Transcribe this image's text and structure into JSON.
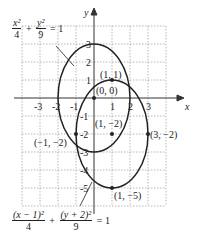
{
  "diagram": {
    "axes": {
      "x_label": "x",
      "y_label": "y",
      "x_ticks": [
        "-3",
        "-2",
        "-1",
        "1",
        "2",
        "3"
      ],
      "y_ticks": [
        "3",
        "2",
        "1",
        "-1",
        "-2",
        "-3",
        "-4",
        "-5"
      ]
    },
    "equations": {
      "original": {
        "num1": "x²",
        "den1": "4",
        "plus": "+",
        "num2": "y²",
        "den2": "9",
        "rhs": "= 1"
      },
      "translated": {
        "num1": "(x − 1)²",
        "den1": "4",
        "plus": "+",
        "num2": "(y + 2)²",
        "den2": "9",
        "rhs": "= 1"
      }
    },
    "points": [
      {
        "label": "(0, 0)"
      },
      {
        "label": "(1, 1)"
      },
      {
        "label": "(1, −2)"
      },
      {
        "label": "(−1, −2)"
      },
      {
        "label": "(3, −2)"
      },
      {
        "label": "(1, −5)"
      }
    ],
    "colors": {
      "curve": "#222222",
      "grid": "#999999",
      "axis": "#333333"
    }
  }
}
